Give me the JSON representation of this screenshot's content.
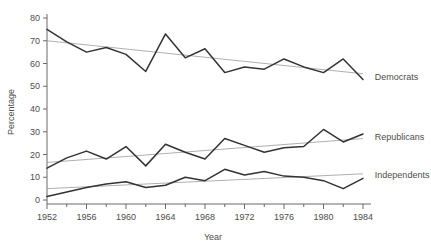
{
  "chart_data": {
    "type": "line",
    "title": "",
    "xlabel": "Year",
    "ylabel": "Percentage",
    "xlim": [
      1952,
      1984
    ],
    "ylim": [
      0,
      80
    ],
    "grid": false,
    "legend_position": "right-inline",
    "x": [
      1952,
      1954,
      1956,
      1958,
      1960,
      1962,
      1964,
      1966,
      1968,
      1970,
      1972,
      1974,
      1976,
      1978,
      1980,
      1982,
      1984
    ],
    "xticks": [
      1952,
      1956,
      1960,
      1964,
      1968,
      1972,
      1976,
      1980,
      1984
    ],
    "xtick_labels": [
      "1952",
      "1956",
      "1960",
      "1964",
      "1968",
      "1972",
      "1976",
      "1980",
      "1984"
    ],
    "xminorticks": [
      1954,
      1958,
      1962,
      1966,
      1970,
      1974,
      1978,
      1982
    ],
    "yticks": [
      0,
      10,
      20,
      30,
      40,
      50,
      60,
      70,
      80
    ],
    "ytick_labels": [
      "0",
      "10",
      "20",
      "30",
      "40",
      "50",
      "60",
      "70",
      "80"
    ],
    "series": [
      {
        "name": "Democrats",
        "label": "Democrats",
        "color": "#333333",
        "values": [
          75.0,
          69.5,
          65.0,
          67.0,
          64.0,
          56.5,
          73.0,
          62.5,
          66.5,
          56.0,
          58.5,
          57.5,
          62.0,
          58.5,
          56.0,
          62.0,
          53.0
        ],
        "trend": {
          "start": 70.0,
          "end": 55.5,
          "color": "#9a9a9a"
        },
        "label_x": 1985.2,
        "label_y": 54.0
      },
      {
        "name": "Republicans",
        "label": "Republicans",
        "color": "#333333",
        "values": [
          14.0,
          18.5,
          21.5,
          18.0,
          23.5,
          15.0,
          24.5,
          21.0,
          18.0,
          27.0,
          24.0,
          21.0,
          23.0,
          23.5,
          31.0,
          25.5,
          29.0
        ],
        "trend": {
          "start": 16.5,
          "end": 27.0,
          "color": "#9a9a9a"
        },
        "label_x": 1985.2,
        "label_y": 27.5
      },
      {
        "name": "Independents",
        "label": "Independents",
        "color": "#333333",
        "values": [
          1.5,
          3.5,
          5.5,
          7.0,
          8.0,
          5.5,
          6.5,
          10.0,
          8.5,
          13.5,
          11.0,
          12.5,
          10.5,
          10.0,
          8.5,
          5.0,
          9.5
        ],
        "trend": {
          "start": 5.0,
          "end": 11.5,
          "color": "#9a9a9a"
        },
        "label_x": 1985.2,
        "label_y": 11.0
      }
    ]
  }
}
